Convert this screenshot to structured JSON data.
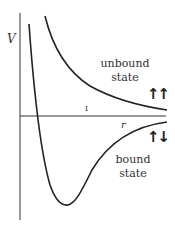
{
  "diagram": {
    "axes": {
      "y_label": "V",
      "x_label": "r"
    },
    "curves": [
      {
        "name": "unbound-state-curve",
        "description": "repulsive curve, positive energy decaying to 0"
      },
      {
        "name": "bound-state-curve",
        "description": "potential well with minimum, approaching 0 from below"
      }
    ],
    "labels": {
      "unbound_line1": "unbound",
      "unbound_line2": "state",
      "bound_line1": "bound",
      "bound_line2": "state",
      "unbound_spins": "↑↑",
      "bound_spins": "↑↓",
      "small_mark": "ı"
    },
    "colors": {
      "stroke": "#222222",
      "axis": "#333333",
      "text": "#333333"
    }
  }
}
